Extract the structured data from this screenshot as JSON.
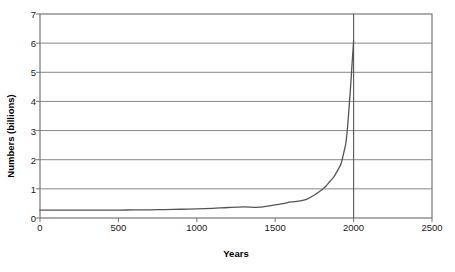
{
  "chart_data": {
    "type": "line",
    "title": "",
    "xlabel": "Years",
    "ylabel": "Numbers (billions)",
    "xlim": [
      0,
      2500
    ],
    "ylim": [
      0,
      7
    ],
    "xticks": [
      0,
      500,
      1000,
      1500,
      2000,
      2500
    ],
    "xtick_labels": [
      "0",
      "500",
      "1000",
      "1500",
      "2000",
      "2500"
    ],
    "yticks": [
      0,
      1,
      2,
      3,
      4,
      5,
      6,
      7
    ],
    "ytick_labels": [
      "0",
      "1",
      "2",
      "3",
      "4",
      "5",
      "6",
      "7"
    ],
    "grid": "horizontal",
    "legend": "none",
    "series": [
      {
        "name": "World population",
        "color": "#555555",
        "x": [
          0,
          100,
          200,
          300,
          400,
          500,
          600,
          700,
          800,
          900,
          1000,
          1100,
          1200,
          1300,
          1400,
          1500,
          1550,
          1600,
          1650,
          1700,
          1750,
          1800,
          1825,
          1850,
          1875,
          1900,
          1910,
          1920,
          1930,
          1940,
          1950,
          1960,
          1970,
          1980,
          1990,
          2000
        ],
        "y": [
          0.27,
          0.27,
          0.27,
          0.27,
          0.27,
          0.27,
          0.28,
          0.28,
          0.29,
          0.3,
          0.31,
          0.33,
          0.36,
          0.38,
          0.37,
          0.45,
          0.49,
          0.55,
          0.58,
          0.64,
          0.79,
          0.98,
          1.1,
          1.26,
          1.42,
          1.65,
          1.75,
          1.86,
          2.07,
          2.3,
          2.55,
          3.03,
          3.7,
          4.44,
          5.27,
          6.07
        ]
      }
    ],
    "annotations": [
      {
        "name": "year-2000-reference-line",
        "type": "vline",
        "x": 2000,
        "color": "#555555"
      }
    ]
  },
  "axis": {
    "y_title": "Numbers (billions)",
    "x_title": "Years"
  }
}
